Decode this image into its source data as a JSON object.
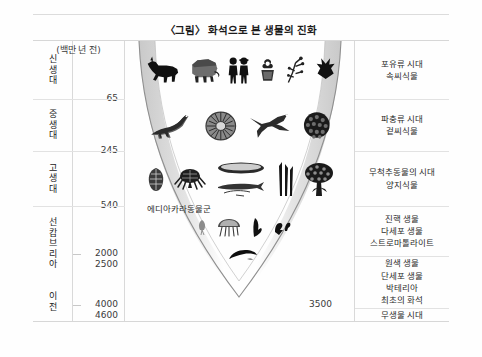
{
  "title": "〈그림〉 화석으로 본 생물의 진화",
  "axis": {
    "unit_label": "(백만 년 전)",
    "ticks": [
      {
        "value": "65",
        "top": 58
      },
      {
        "value": "245",
        "top": 110
      },
      {
        "value": "540",
        "top": 165
      },
      {
        "value": "2000",
        "top": 213
      },
      {
        "value": "2500",
        "top": 224
      },
      {
        "value": "4000",
        "top": 264
      },
      {
        "value": "4600",
        "top": 275
      }
    ]
  },
  "eras": [
    {
      "name": "신생대",
      "chars": [
        "신",
        "생",
        "대"
      ],
      "top": 0,
      "height": 58
    },
    {
      "name": "중생대",
      "chars": [
        "중",
        "생",
        "대"
      ],
      "top": 58,
      "height": 52
    },
    {
      "name": "고생대",
      "chars": [
        "고",
        "생",
        "대"
      ],
      "top": 110,
      "height": 55
    },
    {
      "name": "선캄브리아",
      "chars": [
        "선",
        "캄",
        "브",
        "리",
        "아"
      ],
      "top": 165,
      "height": 75
    },
    {
      "name": "이전",
      "chars": [
        "이",
        "전"
      ],
      "top": 240,
      "height": 42
    }
  ],
  "descriptions": [
    {
      "top": 0,
      "height": 58,
      "lines": [
        "포유류 시대",
        "속씨식물"
      ]
    },
    {
      "top": 58,
      "height": 52,
      "lines": [
        "파충류 시대",
        "겉씨식물"
      ]
    },
    {
      "top": 110,
      "height": 55,
      "lines": [
        "무척추동물의 시대",
        "양지식물"
      ]
    },
    {
      "top": 165,
      "height": 50,
      "lines": [
        "진핵 생물",
        "다세포 생물",
        "스트로마톨라이트"
      ]
    },
    {
      "top": 215,
      "height": 52,
      "lines": [
        "원색 생물",
        "단세포 생물",
        "박테리아",
        "최초의 화석"
      ]
    },
    {
      "top": 267,
      "height": 15,
      "lines": [
        "무생물 시대"
      ]
    }
  ],
  "divider_tops": [
    58,
    110,
    165,
    215,
    267
  ],
  "chart": {
    "ediacara_label": "에디아카라동물군",
    "value_3500": "3500",
    "fossil_rows": [
      {
        "era": "신생대",
        "top": 4,
        "items": [
          "horse-fossil-icon",
          "mammoth-fossil-icon",
          "humans-fossil-icon",
          "flowering-plant-fossil-icon",
          "branch-fossil-icon",
          "leaf-cluster-fossil-icon"
        ]
      },
      {
        "era": "중생대",
        "top": 62,
        "items": [
          "dinosaur-fossil-icon",
          "ammonite-fossil-icon",
          "pterosaur-fossil-icon",
          "conifer-fossil-icon"
        ]
      },
      {
        "era": "고생대",
        "top": 114,
        "items": [
          "shell-fossil-icon",
          "trilobite-fossil-icon",
          "fish-fossil-icon",
          "reed-plant-fossil-icon",
          "tree-fossil-icon"
        ]
      },
      {
        "era": "선캄브리아",
        "top": 172,
        "items": [
          "soft-organism-fossil-icon",
          "jellyfish-fossil-icon",
          "ediacaran-frond-fossil-icon",
          "ediacaran-worm-fossil-icon"
        ]
      },
      {
        "era": "선캄브리아-하단",
        "top": 203,
        "items": [
          "primitive-worm-fossil-icon"
        ]
      }
    ]
  },
  "colors": {
    "background": "#ffffff",
    "text": "#222222",
    "rule": "#dcdcdc",
    "funnel_edge": "#9a9a9a",
    "funnel_fill": "#d6d6d6",
    "fossil": "#1a1a1a"
  }
}
